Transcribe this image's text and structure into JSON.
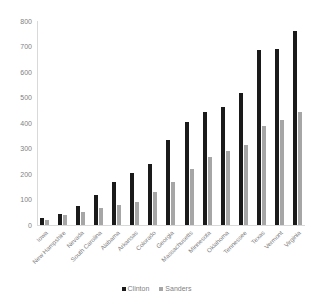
{
  "chart_data": {
    "type": "bar",
    "title": "",
    "xlabel": "",
    "ylabel": "",
    "ylim": [
      0,
      800
    ],
    "yticks": [
      0,
      100,
      200,
      300,
      400,
      500,
      600,
      700,
      800
    ],
    "grid": false,
    "legend_position": "bottom",
    "categories": [
      "Iowa",
      "New Hampshire",
      "Nevada",
      "South Carolina",
      "Alabama",
      "Arkansas",
      "Colorado",
      "Georgia",
      "Massachusetts",
      "Minnesota",
      "Oklahoma",
      "Tennessee",
      "Texas",
      "Vermont",
      "Virginia"
    ],
    "series": [
      {
        "name": "Clinton",
        "color": "#1a1a1a",
        "values": [
          28,
          45,
          75,
          117,
          169,
          205,
          240,
          335,
          403,
          445,
          463,
          516,
          686,
          690,
          762
        ]
      },
      {
        "name": "Sanders",
        "color": "#a6a6a6",
        "values": [
          21,
          38,
          50,
          68,
          78,
          92,
          131,
          170,
          218,
          265,
          289,
          314,
          388,
          411,
          445
        ]
      }
    ]
  },
  "axis": {
    "tick_labels": [
      "800",
      "700",
      "600",
      "500",
      "400",
      "300",
      "200",
      "100",
      "0"
    ]
  },
  "legend": {
    "items": [
      {
        "label": "Clinton",
        "marker": "square-black-marker"
      },
      {
        "label": "Sanders",
        "marker": "square-gray-marker"
      }
    ]
  }
}
